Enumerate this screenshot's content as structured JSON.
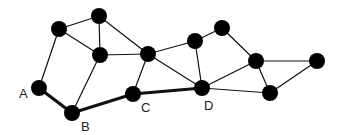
{
  "diagram": {
    "type": "graph",
    "colors": {
      "background": "#ffffff",
      "node": "#000000",
      "edge": "#111111",
      "label": "#222222"
    },
    "node_radius": 8,
    "nodes": [
      {
        "id": "A",
        "label": "A",
        "x": 39,
        "y": 88,
        "label_x": 19,
        "label_y": 98
      },
      {
        "id": "B",
        "label": "B",
        "x": 72,
        "y": 113,
        "label_x": 81,
        "label_y": 131
      },
      {
        "id": "C",
        "label": "C",
        "x": 133,
        "y": 94,
        "label_x": 141,
        "label_y": 112
      },
      {
        "id": "D",
        "label": "D",
        "x": 202,
        "y": 88,
        "label_x": 204,
        "label_y": 110
      },
      {
        "id": "n1",
        "label": "",
        "x": 59,
        "y": 29
      },
      {
        "id": "n2",
        "label": "",
        "x": 99,
        "y": 16
      },
      {
        "id": "n3",
        "label": "",
        "x": 100,
        "y": 55
      },
      {
        "id": "n4",
        "label": "",
        "x": 148,
        "y": 54
      },
      {
        "id": "n5",
        "label": "",
        "x": 195,
        "y": 41
      },
      {
        "id": "n6",
        "label": "",
        "x": 222,
        "y": 28
      },
      {
        "id": "n7",
        "label": "",
        "x": 256,
        "y": 61
      },
      {
        "id": "n8",
        "label": "",
        "x": 317,
        "y": 61
      },
      {
        "id": "n9",
        "label": "",
        "x": 270,
        "y": 93
      }
    ],
    "edges": [
      {
        "from": "A",
        "to": "B",
        "highlighted": true
      },
      {
        "from": "B",
        "to": "C",
        "highlighted": true
      },
      {
        "from": "C",
        "to": "D",
        "highlighted": true
      },
      {
        "from": "A",
        "to": "n1",
        "highlighted": false
      },
      {
        "from": "n1",
        "to": "n2",
        "highlighted": false
      },
      {
        "from": "n1",
        "to": "n3",
        "highlighted": false
      },
      {
        "from": "n2",
        "to": "n3",
        "highlighted": false
      },
      {
        "from": "n2",
        "to": "n4",
        "highlighted": false
      },
      {
        "from": "n3",
        "to": "n4",
        "highlighted": false
      },
      {
        "from": "n3",
        "to": "B",
        "highlighted": false
      },
      {
        "from": "n4",
        "to": "C",
        "highlighted": false
      },
      {
        "from": "n4",
        "to": "D",
        "highlighted": false
      },
      {
        "from": "n4",
        "to": "n5",
        "highlighted": false
      },
      {
        "from": "n5",
        "to": "n6",
        "highlighted": false
      },
      {
        "from": "n5",
        "to": "D",
        "highlighted": false
      },
      {
        "from": "n6",
        "to": "n7",
        "highlighted": false
      },
      {
        "from": "D",
        "to": "n7",
        "highlighted": false
      },
      {
        "from": "D",
        "to": "n9",
        "highlighted": false
      },
      {
        "from": "n7",
        "to": "n8",
        "highlighted": false
      },
      {
        "from": "n7",
        "to": "n9",
        "highlighted": false
      },
      {
        "from": "n8",
        "to": "n9",
        "highlighted": false
      }
    ]
  }
}
